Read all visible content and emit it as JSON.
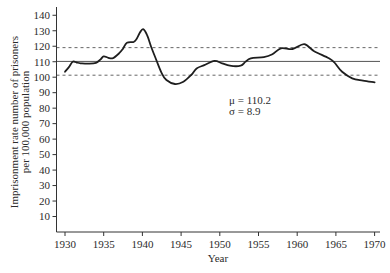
{
  "chart_data": {
    "type": "line",
    "title": "",
    "xlabel": "Year",
    "ylabel": "Imprisonment rate number of prisoners per 100,000 population",
    "ylabel_lines": [
      "Imprisonment rate number of prisoners",
      "per 100,000 population"
    ],
    "xlim": [
      1930,
      1970
    ],
    "ylim": [
      0,
      140
    ],
    "x_ticks": [
      1930,
      1935,
      1940,
      1945,
      1950,
      1955,
      1960,
      1965,
      1970
    ],
    "y_ticks": [
      10,
      20,
      30,
      40,
      50,
      60,
      70,
      80,
      90,
      100,
      110,
      120,
      130,
      140
    ],
    "grid": false,
    "legend": null,
    "series": [
      {
        "name": "Imprisonment rate",
        "x": [
          1930,
          1930.5,
          1931,
          1931.5,
          1932,
          1933,
          1934,
          1934.6,
          1935,
          1935.6,
          1936.2,
          1937,
          1937.5,
          1938,
          1938.9,
          1939.3,
          1939.7,
          1940.1,
          1940.6,
          1941.2,
          1941.8,
          1942.5,
          1943.1,
          1944.2,
          1945.3,
          1946.3,
          1947,
          1948,
          1949.3,
          1950.3,
          1951.3,
          1952.7,
          1953.3,
          1954,
          1955.7,
          1956.8,
          1957.9,
          1959.4,
          1960.9,
          1962.2,
          1964.1,
          1964.8,
          1965.8,
          1967.1,
          1968.5,
          1970
        ],
        "values": [
          103.5,
          106.5,
          110,
          109.5,
          109,
          108.8,
          109.3,
          111.5,
          113.5,
          112.5,
          112.3,
          115.5,
          118.5,
          122.3,
          122.9,
          125.1,
          129,
          131.1,
          127.3,
          118.7,
          111.1,
          102.5,
          98.2,
          95.6,
          97.1,
          101.4,
          105.6,
          107.8,
          110.5,
          109,
          107.4,
          107.4,
          109.9,
          112.2,
          112.9,
          114.8,
          118.7,
          118.2,
          121.3,
          116.8,
          112.2,
          109.5,
          103.5,
          99.3,
          97.8,
          96.7
        ]
      }
    ],
    "reference_lines": [
      {
        "name": "mean-plus-sd",
        "value": 119.1,
        "style": "dashed"
      },
      {
        "name": "mean",
        "value": 110.2,
        "style": "solid"
      },
      {
        "name": "mean-minus-sd",
        "value": 101.3,
        "style": "dashed"
      }
    ],
    "annotations": [
      {
        "text": "μ = 110.2",
        "x_year": 1951.2,
        "y_value": 82.5
      },
      {
        "text": "σ = 8.9",
        "x_year": 1951.2,
        "y_value": 75.5
      }
    ]
  },
  "colors": {
    "background": "#ffffff",
    "series": "#1e1e1e",
    "axis": "#333333",
    "reference": "#555555",
    "text": "#2b2b2b"
  }
}
